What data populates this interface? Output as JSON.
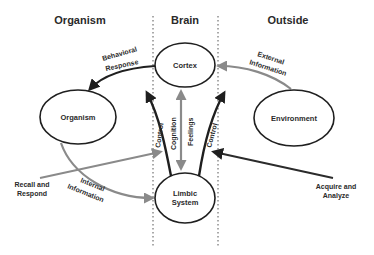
{
  "diagram": {
    "columns": [
      {
        "id": "organism",
        "label": "Organism"
      },
      {
        "id": "brain",
        "label": "Brain"
      },
      {
        "id": "outside",
        "label": "Outside"
      }
    ],
    "nodes": {
      "cortex": {
        "label": "Cortex"
      },
      "limbic_line1": "Limbic",
      "limbic_line2": "System",
      "organism": {
        "label": "Organism"
      },
      "environment": {
        "label": "Environment"
      }
    },
    "edges": {
      "behavioral_line1": "Behavioral",
      "behavioral_line2": "Response",
      "external_line1": "External",
      "external_line2": "Information",
      "internal_line1": "Internal",
      "internal_line2": "Information",
      "control_left": "Control",
      "control_right": "Control",
      "cognition": "Cognition",
      "feelings": "Feelings",
      "recall_line1": "Recall and",
      "recall_line2": "Respond",
      "acquire_line1": "Acquire and",
      "acquire_line2": "Analyze"
    },
    "colors": {
      "dark": "#1f1f1f",
      "gray": "#8a8a8a",
      "text": "#2a2a2a"
    }
  }
}
